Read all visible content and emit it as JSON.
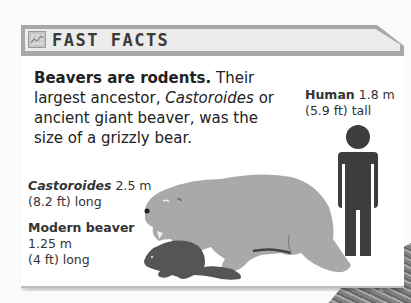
{
  "panel": {
    "title": "FAST FACTS",
    "icon": "chart-icon"
  },
  "intro": {
    "lead_bold": "Beavers are rodents.",
    "text_1": " Their largest ancestor, ",
    "italic_name": "Castoroides",
    "text_2": " or ancient giant beaver, was the size of a grizzly bear."
  },
  "figures": {
    "human": {
      "name": "Human",
      "size_m": "1.8 m",
      "size_ft": "(5.9 ft) tall",
      "color": "#3d3d3d"
    },
    "castoroides": {
      "name": "Castoroides",
      "size_m": "2.5 m",
      "size_ft": "(8.2 ft) long",
      "color": "#a9a9a9"
    },
    "modern_beaver": {
      "name": "Modern beaver",
      "size_m": "1.25 m",
      "size_ft": "(4 ft) long",
      "color": "#555555"
    }
  },
  "colors": {
    "frame": "#a8a8a8",
    "header_bg": "#ececec",
    "text": "#222222"
  }
}
